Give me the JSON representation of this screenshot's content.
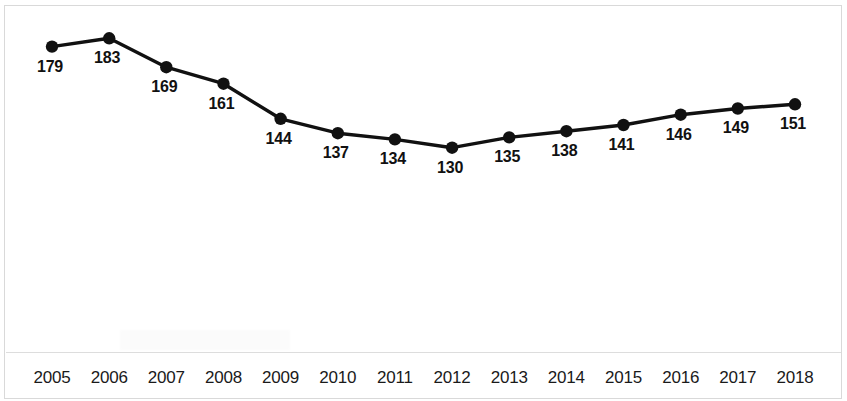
{
  "chart_data": {
    "type": "line",
    "title": "",
    "subtitle": "",
    "xlabel": "",
    "ylabel": "",
    "categories": [
      "2005",
      "2006",
      "2007",
      "2008",
      "2009",
      "2010",
      "2011",
      "2012",
      "2013",
      "2014",
      "2015",
      "2016",
      "2017",
      "2018"
    ],
    "values": [
      179,
      183,
      169,
      161,
      144,
      137,
      134,
      130,
      135,
      138,
      141,
      146,
      149,
      151
    ],
    "series": [
      {
        "name": "",
        "values": [
          179,
          183,
          169,
          161,
          144,
          137,
          134,
          130,
          135,
          138,
          141,
          146,
          149,
          151
        ]
      }
    ],
    "data_labels": [
      "179",
      "183",
      "169",
      "161",
      "144",
      "137",
      "134",
      "130",
      "135",
      "138",
      "141",
      "146",
      "149",
      "151"
    ],
    "tick_labels": [
      "2005",
      "2006",
      "2007",
      "2008",
      "2009",
      "2010",
      "2011",
      "2012",
      "2013",
      "2014",
      "2015",
      "2016",
      "2017",
      "2018"
    ],
    "ylim": [
      125,
      188
    ],
    "xlim": [
      "2005",
      "2018"
    ],
    "grid": false,
    "legend": false,
    "legend_position": "none",
    "line_color": "#111111",
    "marker_color": "#111111",
    "marker_shape": "circle",
    "show_y_axis": false,
    "show_data_labels": true,
    "annotations": []
  },
  "colors": {
    "background": "#ffffff",
    "line": "#111111",
    "marker": "#111111",
    "label_text": "#111111",
    "tick_text": "#1a1a1a",
    "border": "#d9d9d9",
    "axis_rule": "#dddddd"
  }
}
